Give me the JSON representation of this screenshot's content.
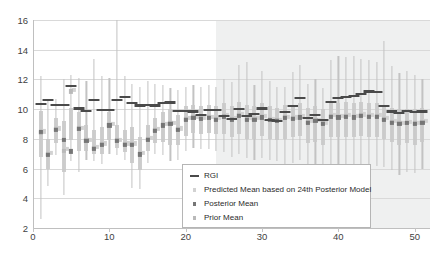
{
  "chart_data": {
    "type": "scatter",
    "title": "",
    "xlabel": "",
    "ylabel": "",
    "xlim": [
      0,
      52
    ],
    "ylim": [
      2,
      16
    ],
    "yticks": [
      2,
      4,
      6,
      8,
      10,
      12,
      14,
      16
    ],
    "xticks": [
      0,
      10,
      20,
      30,
      40,
      50
    ],
    "grid": true,
    "legend_position": "lower-center",
    "shaded_region": {
      "label": "forecast region",
      "x_start": 24,
      "x_end": 52,
      "color": "#eceded"
    },
    "legend": [
      {
        "label": "RGI",
        "marker": "line",
        "color": "#4a4a4a"
      },
      {
        "label": "Predicted Mean based on 24th Posterior Model",
        "marker": "square",
        "color": "#d2d2d2"
      },
      {
        "label": "Posterior Mean",
        "marker": "square",
        "color": "#767676"
      },
      {
        "label": "Prior Mean",
        "marker": "square",
        "color": "#b9b9b9"
      }
    ],
    "x": [
      1,
      2,
      3,
      4,
      5,
      6,
      7,
      8,
      9,
      10,
      11,
      12,
      13,
      14,
      15,
      16,
      17,
      18,
      19,
      20,
      21,
      22,
      23,
      24,
      25,
      26,
      27,
      28,
      29,
      30,
      31,
      32,
      33,
      34,
      35,
      36,
      37,
      38,
      39,
      40,
      41,
      42,
      43,
      44,
      45,
      46,
      47,
      48,
      49,
      50,
      51
    ],
    "series": [
      {
        "name": "RGI",
        "marker": "line",
        "color": "#4a4a4a",
        "values": [
          10.35,
          10.6,
          10.3,
          10.3,
          11.55,
          10.05,
          9.9,
          10.6,
          9.95,
          9.95,
          10.6,
          10.85,
          10.4,
          10.25,
          10.3,
          10.25,
          10.4,
          10.45,
          9.9,
          9.9,
          9.85,
          9.6,
          9.95,
          9.95,
          9.55,
          9.35,
          10.0,
          9.55,
          9.7,
          10.05,
          9.3,
          9.2,
          9.8,
          10.2,
          10.75,
          9.4,
          9.6,
          9.25,
          10.5,
          10.75,
          10.85,
          10.9,
          11.05,
          11.2,
          11.15,
          10.2,
          9.85,
          9.75,
          9.9,
          9.8,
          9.85
        ]
      },
      {
        "name": "Posterior Mean",
        "marker": "square",
        "color": "#767676",
        "values": [
          8.45,
          6.9,
          8.6,
          7.95,
          7.15,
          8.65,
          7.85,
          7.35,
          7.6,
          8.9,
          7.85,
          7.6,
          7.6,
          6.95,
          7.95,
          8.55,
          8.9,
          9.0,
          8.6,
          9.3,
          9.4,
          9.35,
          9.4,
          9.3,
          9.5,
          9.3,
          9.55,
          9.3,
          9.3,
          9.45,
          9.25,
          9.2,
          9.4,
          9.35,
          9.45,
          9.1,
          9.2,
          9.0,
          9.5,
          9.45,
          9.5,
          9.45,
          9.55,
          9.5,
          9.5,
          9.3,
          9.1,
          9.0,
          9.05,
          9.0,
          9.1
        ]
      },
      {
        "name": "Prior Mean",
        "marker": "square",
        "color": "#b9b9b9",
        "values": [
          8.4,
          7.0,
          8.65,
          7.2,
          11.2,
          8.7,
          7.9,
          7.4,
          7.65,
          8.95,
          7.9,
          7.65,
          7.65,
          7.0,
          8.0,
          8.6,
          8.95,
          9.05,
          8.65,
          9.35,
          9.45,
          9.4,
          9.45,
          9.35,
          9.55,
          9.35,
          9.6,
          9.35,
          9.35,
          9.5,
          9.3,
          9.25,
          9.45,
          9.4,
          9.5,
          9.15,
          9.25,
          9.05,
          9.55,
          9.5,
          9.55,
          9.5,
          9.6,
          9.55,
          9.55,
          9.35,
          9.15,
          9.05,
          9.1,
          9.05,
          9.15
        ]
      },
      {
        "name": "Predicted Mean based on 24th Posterior Model",
        "marker": "square",
        "color": "#d2d2d2",
        "values": [
          8.5,
          7.05,
          8.7,
          7.3,
          11.3,
          8.75,
          7.95,
          7.45,
          7.7,
          9.0,
          7.95,
          7.7,
          7.7,
          7.05,
          8.05,
          8.65,
          9.0,
          9.1,
          8.7,
          9.4,
          9.5,
          9.45,
          9.5,
          9.4,
          9.6,
          9.4,
          9.65,
          9.4,
          9.4,
          9.55,
          9.35,
          9.3,
          9.5,
          9.45,
          9.55,
          9.2,
          9.3,
          9.1,
          9.6,
          9.55,
          9.6,
          9.55,
          9.65,
          9.6,
          9.6,
          9.4,
          9.2,
          9.1,
          9.15,
          9.1,
          9.2
        ]
      }
    ],
    "error_bars": {
      "name": "credible interval",
      "color": "#c3c3c3",
      "low": [
        2.6,
        4.8,
        6.9,
        4.2,
        6.5,
        5.8,
        6.6,
        6.5,
        6.3,
        7.0,
        6.9,
        6.6,
        4.7,
        4.6,
        6.4,
        7.0,
        6.9,
        6.5,
        6.6,
        7.2,
        7.4,
        7.3,
        7.3,
        7.2,
        7.1,
        6.8,
        7.0,
        6.7,
        6.6,
        6.7,
        6.6,
        6.5,
        6.2,
        6.4,
        6.6,
        6.0,
        6.1,
        5.9,
        6.2,
        6.2,
        6.1,
        6.2,
        6.3,
        6.2,
        6.2,
        6.1,
        5.9,
        5.6,
        5.8,
        5.7,
        6.0
      ],
      "high": [
        12.2,
        10.6,
        10.7,
        12.0,
        12.3,
        12.1,
        11.9,
        13.4,
        12.2,
        12.1,
        16.0,
        12.2,
        11.7,
        11.5,
        11.9,
        11.7,
        11.6,
        11.4,
        11.3,
        11.5,
        11.6,
        11.5,
        11.6,
        11.5,
        12.0,
        11.8,
        13.0,
        13.2,
        11.6,
        12.6,
        11.9,
        11.5,
        11.5,
        12.5,
        13.0,
        11.7,
        12.0,
        11.4,
        13.3,
        13.6,
        13.5,
        13.6,
        13.4,
        13.3,
        13.2,
        14.6,
        12.9,
        12.4,
        12.6,
        12.3,
        12.0
      ]
    },
    "inner_bars": {
      "name": "inner quartile band",
      "color": "#c9c9c9",
      "low": [
        6.8,
        6.0,
        7.7,
        5.8,
        7.9,
        7.2,
        7.2,
        7.0,
        7.0,
        7.9,
        7.4,
        7.1,
        6.4,
        5.9,
        7.2,
        7.7,
        7.8,
        7.6,
        7.6,
        8.2,
        8.4,
        8.3,
        8.4,
        8.3,
        8.3,
        8.1,
        8.3,
        8.0,
        8.0,
        8.2,
        8.0,
        7.9,
        8.0,
        8.1,
        8.2,
        7.7,
        7.8,
        7.6,
        8.1,
        8.1,
        8.1,
        8.1,
        8.2,
        8.1,
        8.1,
        8.0,
        7.8,
        7.6,
        7.7,
        7.6,
        7.8
      ],
      "high": [
        9.9,
        8.0,
        9.4,
        9.2,
        10.1,
        9.8,
        8.9,
        8.6,
        8.8,
        9.8,
        8.9,
        8.6,
        8.8,
        8.1,
        8.9,
        9.4,
        9.8,
        10.0,
        9.6,
        10.2,
        10.3,
        10.2,
        10.3,
        10.2,
        10.4,
        10.2,
        10.5,
        10.3,
        10.2,
        10.4,
        10.2,
        10.1,
        10.3,
        10.3,
        10.4,
        10.1,
        10.2,
        10.0,
        10.5,
        10.4,
        10.5,
        10.4,
        10.5,
        10.4,
        10.4,
        10.3,
        10.1,
        10.0,
        10.0,
        10.0,
        10.1
      ]
    }
  }
}
